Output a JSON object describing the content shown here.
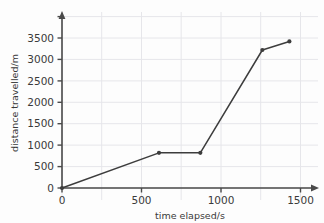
{
  "chart_data": {
    "type": "line",
    "title": "",
    "xlabel": "time elapsed/s",
    "ylabel": "distance travelled/m",
    "xlim": [
      0,
      1600
    ],
    "ylim": [
      0,
      3700
    ],
    "xticks": [
      0,
      500,
      1000,
      1500
    ],
    "yticks": [
      0,
      500,
      1000,
      1500,
      2000,
      2500,
      3000,
      3500
    ],
    "xtick_labels": [
      "0",
      "500",
      "1000",
      "1500"
    ],
    "ytick_labels": [
      "0",
      "500",
      "1000",
      "1500",
      "2000",
      "2500",
      "3000",
      "3500"
    ],
    "grid": true,
    "legend": null,
    "marker": "filled-circle",
    "line_color": "#3d3d3d",
    "grid_color": "#e4e4e8",
    "axis_color": "#4a4a4a",
    "series": [
      {
        "name": "distance travelled",
        "x": [
          0,
          610,
          870,
          1260,
          1430
        ],
        "y": [
          0,
          820,
          820,
          3220,
          3420
        ]
      }
    ]
  },
  "axes": {
    "x_axis_name": "time-axis",
    "y_axis_name": "distance-axis",
    "x_label_text": "time elapsed/s",
    "y_label_text": "distance travelled/m"
  },
  "labels": {
    "y0": "0",
    "y500": "500",
    "y1000": "1000",
    "y1500": "1500",
    "y2000": "2000",
    "y2500": "2500",
    "y3000": "3000",
    "y3500": "3500",
    "x0": "0",
    "x500": "500",
    "x1000": "1000",
    "x1500": "1500"
  }
}
